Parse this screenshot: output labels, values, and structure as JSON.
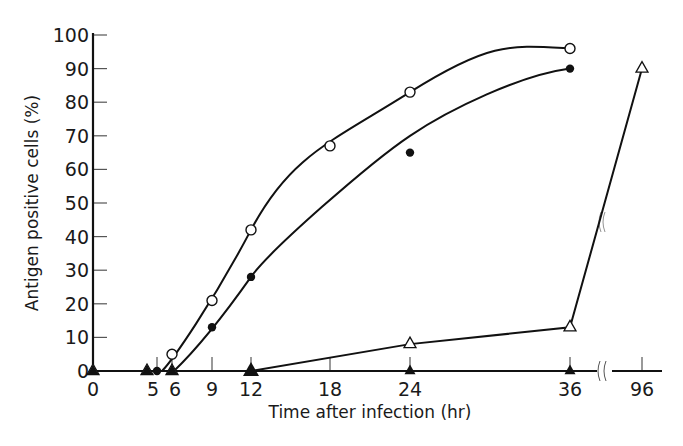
{
  "chart_data": {
    "type": "line",
    "title": "",
    "xlabel": "Time after infection (hr)",
    "ylabel": "Antigen positive cells (%)",
    "ylim": [
      0,
      100
    ],
    "yticks": [
      0,
      10,
      20,
      30,
      40,
      50,
      60,
      70,
      80,
      90,
      100
    ],
    "xticks": [
      0,
      5,
      6,
      9,
      12,
      18,
      24,
      36,
      96
    ],
    "xtick_labels": [
      "0",
      "5",
      "6",
      "9",
      "12",
      "18",
      "24",
      "36",
      "96"
    ],
    "x_axis_break": "between 36 and 96",
    "grid": false,
    "legend": "none",
    "series": [
      {
        "name": "open circles",
        "marker": "open-circle",
        "x": [
          0,
          5,
          6,
          9,
          12,
          18,
          24,
          36
        ],
        "y": [
          0,
          0,
          5,
          21,
          42,
          67,
          83,
          96
        ]
      },
      {
        "name": "filled circles",
        "marker": "filled-circle",
        "x": [
          0,
          5,
          6,
          9,
          12,
          24,
          36
        ],
        "y": [
          0,
          0,
          0,
          13,
          28,
          65,
          90
        ]
      },
      {
        "name": "open triangles",
        "marker": "open-triangle",
        "x": [
          0,
          4,
          6,
          12,
          24,
          36,
          96
        ],
        "y": [
          0,
          0,
          0,
          0,
          8,
          13,
          90
        ]
      },
      {
        "name": "filled triangles",
        "marker": "filled-triangle",
        "x": [
          0,
          4,
          6,
          12,
          24,
          36
        ],
        "y": [
          0,
          0,
          0,
          0,
          0,
          0
        ]
      }
    ]
  }
}
